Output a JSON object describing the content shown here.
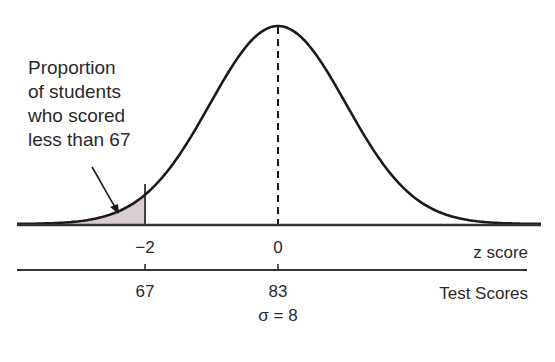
{
  "annotation": {
    "lines": [
      "Proportion",
      "of students",
      "who scored",
      "less than 67"
    ]
  },
  "z_axis": {
    "label": "z score",
    "ticks": [
      {
        "value": "−2",
        "x": 145
      },
      {
        "value": "0",
        "x": 278
      }
    ]
  },
  "score_axis": {
    "label": "Test Scores",
    "ticks": [
      {
        "value": "67",
        "x": 145
      },
      {
        "value": "83",
        "x": 278
      }
    ],
    "sigma_label": "σ = 8"
  },
  "colors": {
    "curve": "#1a1a1a",
    "shade": "#d9cdd1",
    "axis": "#333333"
  },
  "chart_data": {
    "type": "area",
    "title": "",
    "mean": 83,
    "sd": 8,
    "shaded_region": {
      "from": "-inf",
      "to": 67,
      "z_to": -2
    },
    "x_axes": [
      {
        "label": "z score",
        "ticks": [
          -2,
          0
        ]
      },
      {
        "label": "Test Scores",
        "ticks": [
          67,
          83
        ]
      }
    ],
    "annotation": "Proportion of students who scored less than 67",
    "center_line": "dashed vertical at mean"
  }
}
